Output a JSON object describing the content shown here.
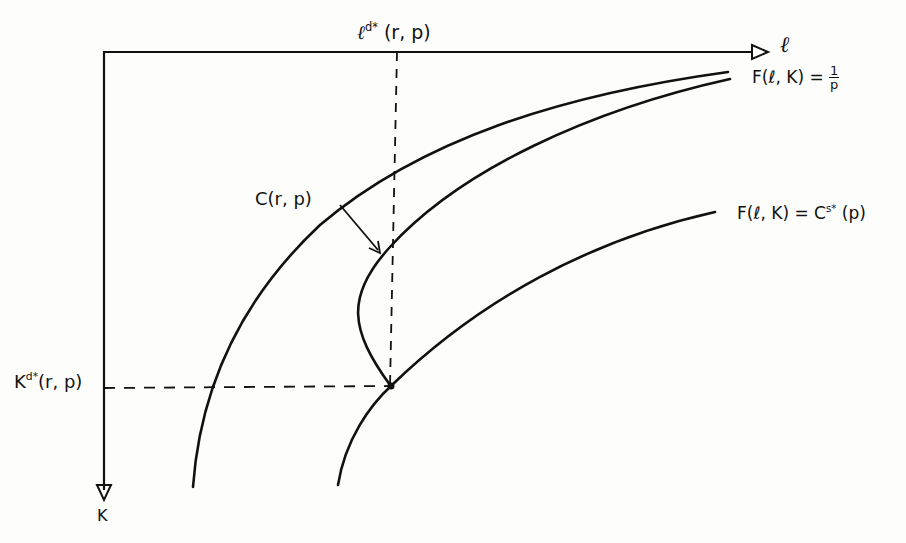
{
  "diagram": {
    "type": "economics-isoquant-diagram",
    "style": "hand-drawn",
    "axes": {
      "horizontal": {
        "label": "ℓ",
        "direction": "right"
      },
      "vertical": {
        "label": "K",
        "direction": "down"
      }
    },
    "labels": {
      "l_star_prefix": "ℓ",
      "l_star_sup": "d*",
      "l_star_args": "(r, p)",
      "k_star_prefix": "K",
      "k_star_sup": "d*",
      "k_star_args": "(r, p)",
      "curve_c": "C(r, p)",
      "isoquant_upper_lhs": "F(ℓ, K) = ",
      "isoquant_upper_num": "1",
      "isoquant_upper_den": "p",
      "isoquant_lower_lhs": "F(ℓ, K) = C",
      "isoquant_lower_sup": "s*",
      "isoquant_lower_args": "(p)"
    },
    "curves": [
      {
        "name": "isoquant F(ℓ,K)=1/p",
        "style": "solid"
      },
      {
        "name": "C(r,p)",
        "style": "solid",
        "note": "backward-bending, touches lower isoquant at optimum"
      },
      {
        "name": "isoquant F(ℓ,K)=C^{s*}(p)",
        "style": "solid"
      }
    ],
    "guides": [
      {
        "name": "vertical dashed line at ℓ^{d*}(r,p)",
        "style": "dashed"
      },
      {
        "name": "horizontal dashed line at K^{d*}(r,p)",
        "style": "dashed"
      }
    ],
    "colors": {
      "ink": "#111111",
      "paper": "#fdfdfc"
    }
  }
}
